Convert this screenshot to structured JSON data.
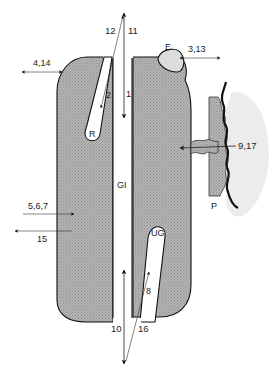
{
  "diagram": {
    "type": "schematic of gland/tooth structure with labelled transport pathways",
    "colors": {
      "tissue_fill": "#a9a9a9",
      "outline": "#111111",
      "background": "#ffffff",
      "plant_shadow": "#e8e8e8"
    },
    "structures": {
      "R": "R",
      "GI": "GI",
      "UG": "UG",
      "E": "E",
      "P": "P"
    },
    "arrow_labels": {
      "top_left_diag": "12",
      "top_vertical": "11",
      "inner_2": "2",
      "inner_1": "1",
      "left_bidirectional": "4,14",
      "right_top_bidirectional": "3,13",
      "right_inward": "9,17",
      "left_inward": "5,6,7",
      "left_outward": "15",
      "bottom_vertical": "10",
      "bottom_diag": "16",
      "inner_8": "8"
    }
  }
}
